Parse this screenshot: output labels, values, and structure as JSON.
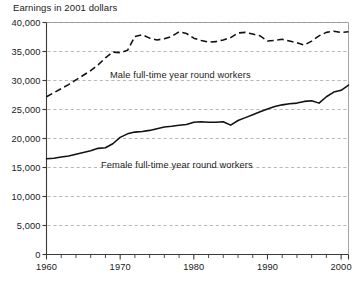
{
  "chart_data": {
    "type": "line",
    "title": "Earnings in 2001 dollars",
    "xlabel": "",
    "ylabel": "",
    "xlim": [
      1960,
      2001
    ],
    "ylim": [
      0,
      40000
    ],
    "grid": true,
    "legend_position": "inline-on-series",
    "y_ticks": [
      0,
      5000,
      10000,
      15000,
      20000,
      25000,
      30000,
      35000,
      40000
    ],
    "y_tick_labels": [
      "0",
      "5,000",
      "10,000",
      "15,000",
      "20,000",
      "25,000",
      "30,000",
      "35,000",
      "40,000"
    ],
    "x_ticks": [
      1960,
      1970,
      1980,
      1990,
      2000
    ],
    "x_tick_labels": [
      "1960",
      "1970",
      "1980",
      "1990",
      "2000"
    ],
    "x_minor_tick_step": 2,
    "x": [
      1960,
      1961,
      1962,
      1963,
      1964,
      1965,
      1966,
      1967,
      1968,
      1969,
      1970,
      1971,
      1972,
      1973,
      1974,
      1975,
      1976,
      1977,
      1978,
      1979,
      1980,
      1981,
      1982,
      1983,
      1984,
      1985,
      1986,
      1987,
      1988,
      1989,
      1990,
      1991,
      1992,
      1993,
      1994,
      1995,
      1996,
      1997,
      1998,
      1999,
      2000,
      2001
    ],
    "series": [
      {
        "name": "Male full-time year round workers",
        "style": "dashed",
        "color": "#111111",
        "label_text": "Male full-time year round workers",
        "values": [
          27200,
          27900,
          28600,
          29300,
          30100,
          30900,
          31700,
          32700,
          33900,
          34900,
          34800,
          35200,
          37600,
          37900,
          37300,
          37000,
          37200,
          37600,
          38400,
          38100,
          37300,
          36900,
          36600,
          36700,
          37000,
          37400,
          38200,
          38300,
          38000,
          37700,
          36800,
          36900,
          37100,
          36800,
          36500,
          36100,
          36800,
          37700,
          38300,
          38500,
          38300,
          38400
        ]
      },
      {
        "name": "Female full-time year round workers",
        "style": "solid",
        "color": "#111111",
        "label_text": "Female full-time year round workers",
        "values": [
          16500,
          16600,
          16800,
          17000,
          17300,
          17600,
          17900,
          18300,
          18400,
          19100,
          20200,
          20800,
          21100,
          21200,
          21400,
          21700,
          22000,
          22100,
          22300,
          22400,
          22800,
          22900,
          22800,
          22800,
          22900,
          22300,
          23100,
          23600,
          24100,
          24600,
          25100,
          25500,
          25800,
          26000,
          26100,
          26400,
          26500,
          26100,
          27200,
          28000,
          28300,
          29200
        ]
      }
    ]
  },
  "caption": {
    "fragment": ""
  }
}
